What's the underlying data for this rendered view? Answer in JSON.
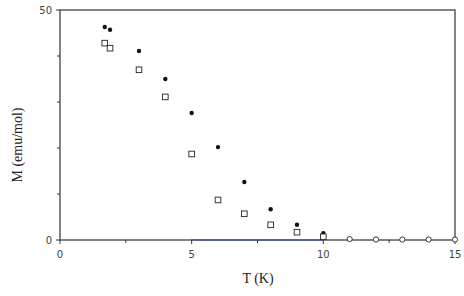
{
  "chart_data": {
    "type": "scatter",
    "title": "",
    "xlabel": "T (K)",
    "ylabel": "M (emu/mol)",
    "xlim": [
      0,
      15
    ],
    "ylim": [
      0,
      50
    ],
    "x_ticks": [
      0,
      5,
      10,
      15
    ],
    "x_minor_ticks": [
      2.5,
      7.5,
      12.5
    ],
    "y_ticks": [
      0,
      50
    ],
    "y_minor_ticks": [
      10,
      20,
      30,
      40
    ],
    "grid": false,
    "legend": null,
    "frame": "box",
    "series": [
      {
        "name": "filled circles",
        "marker": "filled-circle",
        "x": [
          1.7,
          1.9,
          3,
          4,
          5,
          6,
          7,
          8,
          9,
          10
        ],
        "y": [
          46.3,
          45.7,
          41.1,
          35.0,
          27.6,
          20.2,
          12.6,
          6.7,
          3.3,
          1.5
        ]
      },
      {
        "name": "open squares",
        "marker": "open-square",
        "x": [
          1.7,
          1.9,
          3,
          4,
          5,
          6,
          7,
          8,
          9,
          10
        ],
        "y": [
          42.8,
          41.7,
          37.0,
          31.1,
          18.7,
          8.7,
          5.7,
          3.3,
          1.7,
          0.7
        ]
      },
      {
        "name": "open circles",
        "marker": "open-circle",
        "x": [
          11,
          12,
          13,
          14,
          15
        ],
        "y": [
          0.2,
          0.1,
          0.1,
          0.1,
          0.1
        ]
      }
    ],
    "colors": {
      "axis": "#333333",
      "marker": "#111111",
      "axis_accent": "#3344aa"
    }
  }
}
